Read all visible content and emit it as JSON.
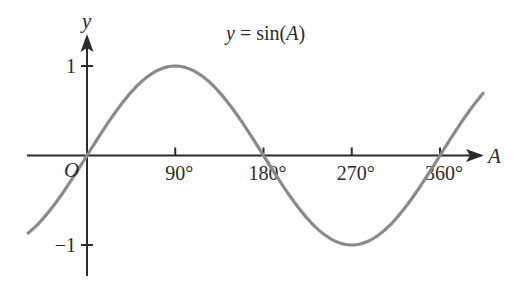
{
  "chart_data": {
    "type": "line",
    "title": "y = sin(A)",
    "title_parts": {
      "lhs": "y",
      "eq": " = sin(",
      "arg": "A",
      "close": ")"
    },
    "xlabel": "A",
    "ylabel": "y",
    "origin_label": "O",
    "x_ticks": [
      {
        "value": 90,
        "label": "90°"
      },
      {
        "value": 180,
        "label": "180°"
      },
      {
        "value": 270,
        "label": "270°"
      },
      {
        "value": 360,
        "label": "360°"
      }
    ],
    "y_ticks": [
      {
        "value": 1,
        "label": "1"
      },
      {
        "value": -1,
        "label": "−1"
      }
    ],
    "xlim": [
      -60,
      405
    ],
    "ylim": [
      -1.2,
      1.2
    ],
    "grid": false,
    "legend": null,
    "series": [
      {
        "name": "y = sin(A)",
        "function": "sin",
        "x": [
          -60,
          -30,
          0,
          30,
          60,
          90,
          120,
          150,
          180,
          210,
          240,
          270,
          300,
          330,
          360,
          390,
          405
        ],
        "values": [
          -0.866,
          -0.5,
          0,
          0.5,
          0.866,
          1,
          0.866,
          0.5,
          0,
          -0.5,
          -0.866,
          -1,
          -0.866,
          -0.5,
          0,
          0.5,
          0.707
        ],
        "color": "#8a8a8a"
      }
    ],
    "axis_color": "#2b2b2b"
  }
}
